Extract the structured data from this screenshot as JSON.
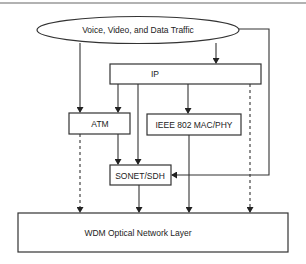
{
  "diagram": {
    "traffic_label": "Voice, Video, and Data Traffic",
    "nodes": {
      "ip": "IP",
      "atm": "ATM",
      "ieee": "IEEE 802 MAC/PHY",
      "sonet": "SONET/SDH",
      "wdm": "WDM Optical Network Layer"
    },
    "edges": [
      {
        "from": "traffic",
        "to": "ip",
        "style": "solid"
      },
      {
        "from": "traffic",
        "to": "atm",
        "style": "solid"
      },
      {
        "from": "traffic",
        "to": "sonet",
        "style": "solid"
      },
      {
        "from": "ip",
        "to": "atm",
        "style": "solid"
      },
      {
        "from": "ip",
        "to": "sonet",
        "style": "solid"
      },
      {
        "from": "ip",
        "to": "ieee",
        "style": "solid"
      },
      {
        "from": "ip",
        "to": "wdm",
        "style": "dashed"
      },
      {
        "from": "atm",
        "to": "sonet",
        "style": "solid"
      },
      {
        "from": "atm",
        "to": "wdm",
        "style": "dashed"
      },
      {
        "from": "ieee",
        "to": "wdm",
        "style": "solid"
      },
      {
        "from": "sonet",
        "to": "wdm",
        "style": "solid"
      }
    ]
  }
}
